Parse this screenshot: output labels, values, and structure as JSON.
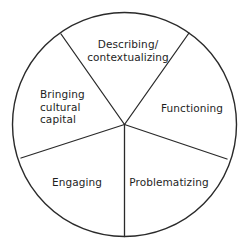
{
  "diagram": {
    "type": "segmented-circle",
    "segment_count": 5,
    "line_color": "#2a2a2a",
    "text_color": "#1e1e1e",
    "background_color": "#ffffff",
    "segments": [
      {
        "id": "describing",
        "position": "top",
        "lines": [
          "Describing/",
          "contextualizing"
        ]
      },
      {
        "id": "functioning",
        "position": "right",
        "lines": [
          "Functioning"
        ]
      },
      {
        "id": "problematizing",
        "position": "bottom-right",
        "lines": [
          "Problematizing"
        ]
      },
      {
        "id": "engaging",
        "position": "bottom-left",
        "lines": [
          "Engaging"
        ]
      },
      {
        "id": "bringing-cultural-capital",
        "position": "left",
        "lines": [
          "Bringing",
          "cultural",
          "capital"
        ]
      }
    ]
  }
}
